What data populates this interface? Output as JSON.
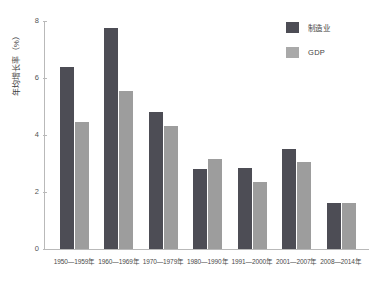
{
  "chart_data": {
    "type": "bar",
    "title": "",
    "xlabel": "",
    "ylabel": "年均增长率（%）",
    "ylim": [
      0,
      8
    ],
    "yticks": [
      0,
      2,
      4,
      6,
      8
    ],
    "ytick_labels": [
      "0",
      "2",
      "4",
      "6",
      "8"
    ],
    "grid": false,
    "legend_position": "top-right",
    "categories": [
      "1950—1959年",
      "1960—1969年",
      "1970—1979年",
      "1980—1990年",
      "1991—2000年",
      "2001—2007年",
      "2008—2014年"
    ],
    "series": [
      {
        "name": "制造业",
        "color": "#4d4d55",
        "values": [
          6.4,
          7.75,
          4.8,
          2.8,
          2.85,
          3.5,
          1.6
        ]
      },
      {
        "name": "GDP",
        "color": "#9d9d9d",
        "values": [
          4.45,
          5.55,
          4.3,
          3.15,
          2.35,
          3.05,
          1.6
        ]
      }
    ]
  }
}
